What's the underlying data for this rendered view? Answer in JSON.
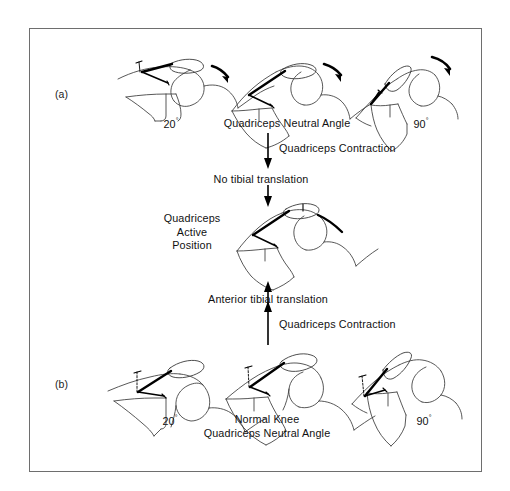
{
  "figure": {
    "type": "anatomical-diagram",
    "border_color": "#6e6e6e",
    "background_color": "#ffffff",
    "line_color": "#3a3a3a",
    "accent_color": "#000000"
  },
  "panels": [
    {
      "id": "a",
      "label": "(a)"
    },
    {
      "id": "b",
      "label": "(b)"
    }
  ],
  "panel_a": {
    "letter": "(a)",
    "captions": [
      {
        "name": "angle-20",
        "text": "20",
        "degree": "°"
      },
      {
        "name": "quadriceps-neutral-angle",
        "text": "Quadriceps Neutral Angle"
      },
      {
        "name": "angle-90",
        "text": "90",
        "degree": "°"
      }
    ],
    "knees": [
      {
        "name": "knee-a-20",
        "flexion": "20°",
        "rotation_arrow": "clockwise-posterior"
      },
      {
        "name": "knee-a-neutral",
        "flexion": "neutral",
        "rotation_arrow": "clockwise-posterior"
      },
      {
        "name": "knee-a-90",
        "flexion": "90°",
        "rotation_arrow": "clockwise-posterior"
      }
    ]
  },
  "panel_b": {
    "letter": "(b)",
    "captions": [
      {
        "name": "angle-20",
        "text": "20",
        "degree": "°"
      },
      {
        "name": "normal-knee",
        "line1": "Normal Knee",
        "line2": "Quadriceps Neutral Angle"
      },
      {
        "name": "angle-90",
        "text": "90",
        "degree": "°"
      }
    ],
    "knees": [
      {
        "name": "knee-b-20",
        "flexion": "20°"
      },
      {
        "name": "knee-b-neutral",
        "flexion": "neutral"
      },
      {
        "name": "knee-b-90",
        "flexion": "90°"
      }
    ]
  },
  "center": {
    "label_line1": "Quadriceps",
    "label_line2": "Active",
    "label_line3": "Position",
    "knee_name": "knee-center-active"
  },
  "flow": {
    "top_arrow_label": "Quadriceps Contraction",
    "top_result_label": "No tibial translation",
    "bottom_result_label": "Anterior tibial translation",
    "bottom_arrow_label": "Quadriceps Contraction",
    "top_direction": "down",
    "bottom_direction": "up"
  }
}
